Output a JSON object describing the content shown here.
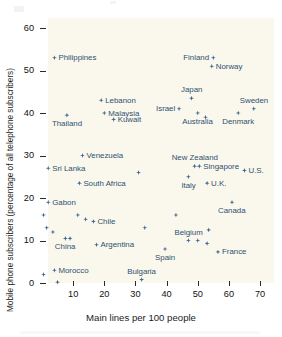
{
  "chart_data": {
    "type": "scatter",
    "title": "",
    "xlabel": "Main lines per 100 people",
    "ylabel": "Mobile phone subscribers (percentage of all telephone subscribers)",
    "xlim": [
      0,
      72
    ],
    "ylim": [
      -1,
      64
    ],
    "xticks": [
      10,
      20,
      30,
      40,
      50,
      60,
      70
    ],
    "yticks": [
      0,
      10,
      20,
      30,
      40,
      50,
      60
    ],
    "grid": false,
    "legend": null,
    "marker_color": "#3b6490",
    "plot_background": "#faf8ec",
    "points": [
      {
        "name": "Philippines",
        "x": 4.0,
        "y": 53.0,
        "label": "Philippines",
        "label_pos": "right"
      },
      {
        "name": "Finland",
        "x": 55.0,
        "y": 53.0,
        "label": "Finland",
        "label_pos": "left"
      },
      {
        "name": "Norway",
        "x": 54.5,
        "y": 51.0,
        "label": "Norway",
        "label_pos": "right"
      },
      {
        "name": "Japan",
        "x": 48.0,
        "y": 43.5,
        "label": "Japan",
        "label_pos": "above"
      },
      {
        "name": "Lebanon",
        "x": 19.0,
        "y": 43.0,
        "label": "Lebanon",
        "label_pos": "right"
      },
      {
        "name": "Sweden",
        "x": 68.0,
        "y": 41.0,
        "label": "Sweden",
        "label_pos": "above"
      },
      {
        "name": "Israel",
        "x": 44.0,
        "y": 41.0,
        "label": "Israel",
        "label_pos": "left"
      },
      {
        "name": "Malaysia",
        "x": 20.0,
        "y": 40.0,
        "label": "Malaysia",
        "label_pos": "right"
      },
      {
        "name": "Thailand",
        "x": 8.0,
        "y": 39.5,
        "label": "Thailand",
        "label_pos": "below"
      },
      {
        "name": "Australia",
        "x": 50.0,
        "y": 40.0,
        "label": "Australia",
        "label_pos": "below"
      },
      {
        "name": "Denmark",
        "x": 63.0,
        "y": 40.0,
        "label": "Denmark",
        "label_pos": "below"
      },
      {
        "name": "Kuwait",
        "x": 23.0,
        "y": 38.5,
        "label": "Kuwait",
        "label_pos": "right"
      },
      {
        "name": "Australia2",
        "x": 52.5,
        "y": 39.0,
        "label": "",
        "label_pos": "none"
      },
      {
        "name": "Venezuela",
        "x": 13.0,
        "y": 30.0,
        "label": "Venezuela",
        "label_pos": "right"
      },
      {
        "name": "New Zealand",
        "x": 49.0,
        "y": 27.5,
        "label": "New Zealand",
        "label_pos": "above"
      },
      {
        "name": "Singapore",
        "x": 50.5,
        "y": 27.5,
        "label": "Singapore",
        "label_pos": "right"
      },
      {
        "name": "Sri Lanka",
        "x": 2.0,
        "y": 27.0,
        "label": "Sri Lanka",
        "label_pos": "right"
      },
      {
        "name": "U.S.",
        "x": 65.0,
        "y": 26.5,
        "label": "U.S.",
        "label_pos": "right"
      },
      {
        "name": "Unlabeled-26",
        "x": 31.0,
        "y": 26.0,
        "label": "",
        "label_pos": "none"
      },
      {
        "name": "Italy",
        "x": 47.0,
        "y": 25.0,
        "label": "Italy",
        "label_pos": "below"
      },
      {
        "name": "South Africa",
        "x": 12.0,
        "y": 23.5,
        "label": "South Africa",
        "label_pos": "right"
      },
      {
        "name": "U.K.",
        "x": 53.0,
        "y": 23.5,
        "label": "U.K.",
        "label_pos": "right"
      },
      {
        "name": "Gabon",
        "x": 2.0,
        "y": 19.0,
        "label": "Gabon",
        "label_pos": "right"
      },
      {
        "name": "Canada",
        "x": 61.0,
        "y": 19.0,
        "label": "Canada",
        "label_pos": "below"
      },
      {
        "name": "Unlabeled-16",
        "x": 0.5,
        "y": 16.0,
        "label": "",
        "label_pos": "none"
      },
      {
        "name": "Unlabeled-16b",
        "x": 11.5,
        "y": 16.0,
        "label": "",
        "label_pos": "none"
      },
      {
        "name": "Unlabeled-16c",
        "x": 43.0,
        "y": 16.0,
        "label": "",
        "label_pos": "none"
      },
      {
        "name": "Unlabeled-15",
        "x": 14.0,
        "y": 15.0,
        "label": "",
        "label_pos": "none"
      },
      {
        "name": "Chile",
        "x": 16.5,
        "y": 14.5,
        "label": "Chile",
        "label_pos": "right"
      },
      {
        "name": "Unlabeled-13",
        "x": 1.5,
        "y": 13.0,
        "label": "",
        "label_pos": "none"
      },
      {
        "name": "Unlabeled-13b",
        "x": 33.0,
        "y": 13.0,
        "label": "",
        "label_pos": "none"
      },
      {
        "name": "Unlabeled-12",
        "x": 3.5,
        "y": 12.0,
        "label": "",
        "label_pos": "none"
      },
      {
        "name": "Unlabeled-12b",
        "x": 53.5,
        "y": 12.5,
        "label": "",
        "label_pos": "none"
      },
      {
        "name": "China",
        "x": 7.5,
        "y": 10.5,
        "label": "China",
        "label_pos": "below"
      },
      {
        "name": "China2",
        "x": 9.0,
        "y": 10.5,
        "label": "",
        "label_pos": "none"
      },
      {
        "name": "Belgium",
        "x": 47.0,
        "y": 10.0,
        "label": "Belgium",
        "label_pos": "above"
      },
      {
        "name": "Belgium2",
        "x": 50.0,
        "y": 10.0,
        "label": "",
        "label_pos": "none"
      },
      {
        "name": "Unlabeled-9",
        "x": 53.0,
        "y": 9.3,
        "label": "",
        "label_pos": "none"
      },
      {
        "name": "Argentina",
        "x": 17.5,
        "y": 9.0,
        "label": "Argentina",
        "label_pos": "right"
      },
      {
        "name": "Spain",
        "x": 39.5,
        "y": 8.0,
        "label": "Spain",
        "label_pos": "below"
      },
      {
        "name": "France",
        "x": 56.5,
        "y": 7.3,
        "label": "France",
        "label_pos": "right"
      },
      {
        "name": "Morocco",
        "x": 4.0,
        "y": 3.0,
        "label": "Morocco",
        "label_pos": "right"
      },
      {
        "name": "Unlabeled-2",
        "x": 0.5,
        "y": 2.0,
        "label": "",
        "label_pos": "none"
      },
      {
        "name": "Bulgaria",
        "x": 32.0,
        "y": 0.8,
        "label": "Bulgaria",
        "label_pos": "above"
      },
      {
        "name": "Unlabeled-0",
        "x": 5.0,
        "y": 0.2,
        "label": "",
        "label_pos": "none"
      }
    ]
  },
  "axes": {
    "y_tick_labels": [
      "60",
      "50",
      "40",
      "30",
      "20",
      "10",
      "0"
    ],
    "x_tick_labels": [
      "10",
      "20",
      "30",
      "40",
      "50",
      "60",
      "70"
    ],
    "x_title": "Main lines per 100 people",
    "y_title": "Mobile phone subscribers (percentage of all telephone subscribers)"
  }
}
